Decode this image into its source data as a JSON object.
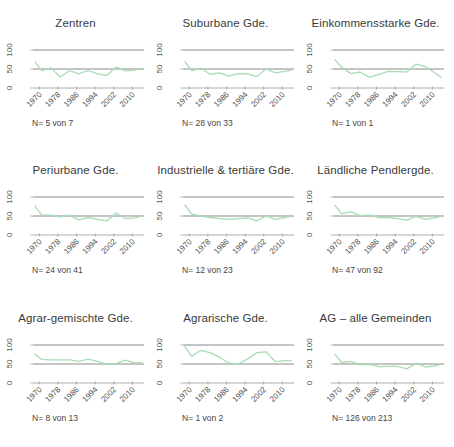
{
  "style": {
    "line_color": "#a9dcb5",
    "ref_line_color": "#8a8a8a",
    "axis_color": "#999999",
    "text_color": "#3a3a3a"
  },
  "chart_data": [
    {
      "type": "line",
      "title": "Zentren",
      "n_label": "N= 5 von 7",
      "xlabel": "",
      "ylabel": "",
      "ylim": [
        0,
        100
      ],
      "yticks": [
        0,
        50,
        100
      ],
      "xticks": [
        1970,
        1978,
        1986,
        1994,
        2002,
        2010
      ],
      "ref_lines": [
        50,
        100
      ],
      "x": [
        1968,
        1971,
        1975,
        1979,
        1983,
        1987,
        1991,
        1995,
        1999,
        2003,
        2007,
        2011,
        2014
      ],
      "values": [
        70,
        46,
        53,
        29,
        46,
        37,
        46,
        37,
        33,
        55,
        45,
        47,
        52
      ]
    },
    {
      "type": "line",
      "title": "Suburbane Gde.",
      "n_label": "N= 28 von 33",
      "xlabel": "",
      "ylabel": "",
      "ylim": [
        0,
        100
      ],
      "yticks": [
        0,
        50,
        100
      ],
      "xticks": [
        1970,
        1978,
        1986,
        1994,
        2002,
        2010
      ],
      "ref_lines": [
        50,
        100
      ],
      "x": [
        1968,
        1971,
        1975,
        1979,
        1983,
        1987,
        1991,
        1995,
        1999,
        2003,
        2007,
        2011,
        2014
      ],
      "values": [
        70,
        46,
        52,
        36,
        40,
        31,
        38,
        37,
        30,
        50,
        40,
        44,
        47
      ]
    },
    {
      "type": "line",
      "title": "Einkommensstarke Gde.",
      "n_label": "N= 1 von 1",
      "xlabel": "",
      "ylabel": "",
      "ylim": [
        0,
        100
      ],
      "yticks": [
        0,
        50,
        100
      ],
      "xticks": [
        1970,
        1978,
        1986,
        1994,
        2002,
        2010
      ],
      "ref_lines": [
        50,
        100
      ],
      "x": [
        1968,
        1971,
        1975,
        1979,
        1983,
        1987,
        1991,
        1995,
        1999,
        2003,
        2007,
        2011,
        2014
      ],
      "values": [
        75,
        55,
        38,
        42,
        28,
        36,
        44,
        43,
        42,
        63,
        56,
        40,
        27
      ]
    },
    {
      "type": "line",
      "title": "Periurbane Gde.",
      "n_label": "N= 24 von 41",
      "xlabel": "",
      "ylabel": "",
      "ylim": [
        0,
        100
      ],
      "yticks": [
        0,
        50,
        100
      ],
      "xticks": [
        1970,
        1978,
        1986,
        1994,
        2002,
        2010
      ],
      "ref_lines": [
        50,
        100
      ],
      "x": [
        1968,
        1971,
        1975,
        1979,
        1983,
        1987,
        1991,
        1995,
        1999,
        2003,
        2007,
        2011,
        2014
      ],
      "values": [
        77,
        53,
        52,
        48,
        52,
        40,
        46,
        41,
        37,
        58,
        43,
        45,
        50
      ]
    },
    {
      "type": "line",
      "title": "Industrielle & tertiäre Gde.",
      "n_label": "N= 12 von 23",
      "xlabel": "",
      "ylabel": "",
      "ylim": [
        0,
        100
      ],
      "yticks": [
        0,
        50,
        100
      ],
      "xticks": [
        1970,
        1978,
        1986,
        1994,
        2002,
        2010
      ],
      "ref_lines": [
        50,
        100
      ],
      "x": [
        1968,
        1971,
        1975,
        1979,
        1983,
        1987,
        1991,
        1995,
        1999,
        2003,
        2007,
        2011,
        2014
      ],
      "values": [
        80,
        55,
        50,
        46,
        43,
        41,
        43,
        45,
        37,
        50,
        41,
        46,
        50
      ]
    },
    {
      "type": "line",
      "title": "Ländliche Pendlergde.",
      "n_label": "N= 47 von 92",
      "xlabel": "",
      "ylabel": "",
      "ylim": [
        0,
        100
      ],
      "yticks": [
        0,
        50,
        100
      ],
      "xticks": [
        1970,
        1978,
        1986,
        1994,
        2002,
        2010
      ],
      "ref_lines": [
        50,
        100
      ],
      "x": [
        1968,
        1971,
        1975,
        1979,
        1983,
        1987,
        1991,
        1995,
        1999,
        2003,
        2007,
        2011,
        2014
      ],
      "values": [
        79,
        56,
        61,
        51,
        52,
        46,
        46,
        43,
        39,
        49,
        41,
        45,
        50
      ]
    },
    {
      "type": "line",
      "title": "Agrar-gemischte Gde.",
      "n_label": "N= 8 von 13",
      "xlabel": "",
      "ylabel": "",
      "ylim": [
        0,
        100
      ],
      "yticks": [
        0,
        50,
        100
      ],
      "xticks": [
        1970,
        1978,
        1986,
        1994,
        2002,
        2010
      ],
      "ref_lines": [
        50,
        100
      ],
      "x": [
        1968,
        1971,
        1975,
        1979,
        1983,
        1987,
        1991,
        1995,
        1999,
        2003,
        2007,
        2011,
        2014
      ],
      "values": [
        76,
        62,
        61,
        61,
        61,
        57,
        63,
        57,
        50,
        51,
        60,
        53,
        54
      ]
    },
    {
      "type": "line",
      "title": "Agrarische Gde.",
      "n_label": "N= 1 von 2",
      "xlabel": "",
      "ylabel": "",
      "ylim": [
        0,
        100
      ],
      "yticks": [
        0,
        50,
        100
      ],
      "xticks": [
        1970,
        1978,
        1986,
        1994,
        2002,
        2010
      ],
      "ref_lines": [
        50,
        100
      ],
      "x": [
        1968,
        1971,
        1975,
        1979,
        1983,
        1987,
        1991,
        1995,
        1999,
        2003,
        2007,
        2011,
        2014
      ],
      "values": [
        97,
        70,
        86,
        80,
        68,
        52,
        50,
        63,
        80,
        82,
        56,
        59,
        59
      ]
    },
    {
      "type": "line",
      "title": "AG – alle Gemeinden",
      "n_label": "N= 126 von 213",
      "xlabel": "",
      "ylabel": "",
      "ylim": [
        0,
        100
      ],
      "yticks": [
        0,
        50,
        100
      ],
      "xticks": [
        1970,
        1978,
        1986,
        1994,
        2002,
        2010
      ],
      "ref_lines": [
        50,
        100
      ],
      "x": [
        1968,
        1971,
        1975,
        1979,
        1983,
        1987,
        1991,
        1995,
        1999,
        2003,
        2007,
        2011,
        2014
      ],
      "values": [
        77,
        54,
        57,
        48,
        49,
        43,
        44,
        44,
        37,
        52,
        42,
        45,
        50
      ]
    }
  ]
}
